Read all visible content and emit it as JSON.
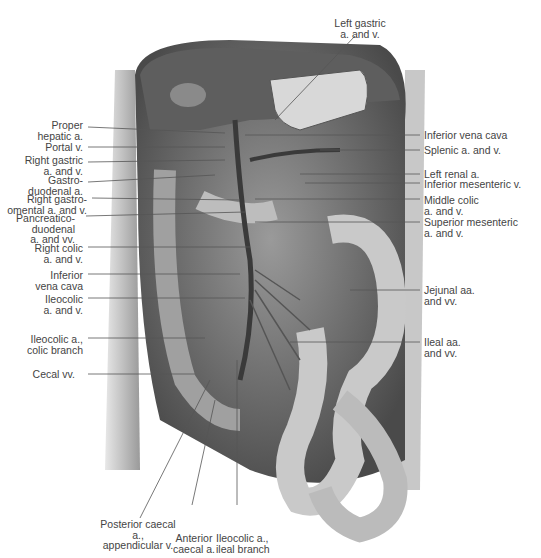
{
  "figure": {
    "labels_left": [
      {
        "id": "proper-hepatic",
        "text": "Proper\nhepatic a."
      },
      {
        "id": "portal-v",
        "text": "Portal v."
      },
      {
        "id": "right-gastric",
        "text": "Right gastric\na. and v."
      },
      {
        "id": "gastroduodenal",
        "text": "Gastro-\nduodenal a."
      },
      {
        "id": "right-gastroomental",
        "text": "Right gastro-\nomental a. and v."
      },
      {
        "id": "pancreaticoduodenal",
        "text": "Pancreatico-\nduodenal\na. and vv."
      },
      {
        "id": "right-colic",
        "text": "Right colic\na. and v."
      },
      {
        "id": "inferior-vena-cava-left",
        "text": "Inferior\nvena cava"
      },
      {
        "id": "ileocolic",
        "text": "Ileocolic\na. and v."
      },
      {
        "id": "ileocolic-colic-branch",
        "text": "Ileocolic a.,\ncolic branch"
      },
      {
        "id": "cecal-vv",
        "text": "Cecal vv."
      }
    ],
    "labels_right": [
      {
        "id": "inferior-vena-cava-right",
        "text": "Inferior vena cava"
      },
      {
        "id": "splenic",
        "text": "Splenic a. and v."
      },
      {
        "id": "left-renal",
        "text": "Left renal a."
      },
      {
        "id": "inferior-mesenteric",
        "text": "Inferior mesenteric v."
      },
      {
        "id": "middle-colic",
        "text": "Middle colic\na. and v."
      },
      {
        "id": "superior-mesenteric",
        "text": "Superior mesenteric\na. and v."
      },
      {
        "id": "jejunal",
        "text": "Jejunal aa.\nand vv."
      },
      {
        "id": "ileal",
        "text": "Ileal aa.\nand vv."
      }
    ],
    "labels_top": [
      {
        "id": "left-gastric",
        "text": "Left gastric\na. and v."
      }
    ],
    "labels_bottom": [
      {
        "id": "posterior-caecal",
        "text": "Posterior caecal a.,\nappendicular v."
      },
      {
        "id": "anterior-caecal",
        "text": "Anterior\ncaecal a."
      },
      {
        "id": "ileocolic-ileal-branch",
        "text": "Ileocolic a.,\nileal branch"
      }
    ]
  }
}
